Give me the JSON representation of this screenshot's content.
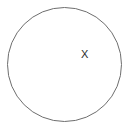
{
  "figure": {
    "type": "geometry-diagram",
    "canvas": {
      "width": 134,
      "height": 132,
      "background_color": "#ffffff"
    },
    "shapes": [
      {
        "name": "circle",
        "kind": "circle",
        "center_x": 64.5,
        "center_y": 64.5,
        "radius": 57,
        "stroke_color": "#6e6e6e",
        "stroke_width": 1,
        "fill": "none"
      }
    ],
    "labels": [
      {
        "name": "point-label-x",
        "text": "X",
        "x": 85,
        "y": 55,
        "color": "#2b2b2b",
        "font_size": 11,
        "position_description": "inside circle, right of center"
      }
    ]
  }
}
